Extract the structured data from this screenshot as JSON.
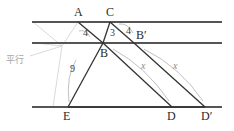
{
  "figure": {
    "type": "geometry-diagram",
    "colors": {
      "parallel_line": "#555555",
      "segment": "#333333",
      "arc": "#b9b9b9",
      "helper": "#cfcfcf",
      "label": "#2b2b2b",
      "x_label": "#8a8a8a",
      "parallel_note": "#a8a8a8",
      "background": "#ffffff"
    },
    "parallel_lines": [
      {
        "name": "top-line",
        "y": 22,
        "x1": 32,
        "x2": 222
      },
      {
        "name": "middle-line",
        "y": 43,
        "x1": 32,
        "x2": 222
      },
      {
        "name": "bottom-line",
        "y": 107,
        "x1": 32,
        "x2": 222
      }
    ],
    "points": [
      {
        "id": "A",
        "label": "A",
        "x": 78,
        "y": 22,
        "label_x": 74,
        "label_y": 6
      },
      {
        "id": "C",
        "label": "C",
        "x": 110,
        "y": 22,
        "label_x": 106,
        "label_y": 6
      },
      {
        "id": "B",
        "label": "B",
        "x": 103,
        "y": 43,
        "label_x": 100,
        "label_y": 47
      },
      {
        "id": "Bp",
        "label": "B′",
        "x": 134,
        "y": 43,
        "label_x": 136,
        "label_y": 29
      },
      {
        "id": "E",
        "label": "E",
        "x": 68,
        "y": 107,
        "label_x": 63,
        "label_y": 110
      },
      {
        "id": "D",
        "label": "D",
        "x": 172,
        "y": 107,
        "label_x": 167,
        "label_y": 110
      },
      {
        "id": "Dp",
        "label": "D′",
        "x": 205,
        "y": 107,
        "label_x": 201,
        "label_y": 110
      }
    ],
    "segments": [
      {
        "name": "A-B",
        "from": "A",
        "to": "B"
      },
      {
        "name": "C-B",
        "from": "C",
        "to": "B"
      },
      {
        "name": "C-Bp",
        "from": "C",
        "to": "Bp"
      },
      {
        "name": "B-E",
        "from": "B",
        "to": "E"
      },
      {
        "name": "B-D",
        "from": "B",
        "to": "D"
      },
      {
        "name": "Bp-Dp",
        "from": "Bp",
        "to": "Dp"
      },
      {
        "name": "E-D",
        "from": "E",
        "to": "D"
      },
      {
        "name": "D-Dp",
        "from": "D",
        "to": "Dp"
      }
    ],
    "measure_labels": [
      {
        "name": "measure-AB",
        "text": "4",
        "x": 83,
        "y": 28,
        "kind": "num"
      },
      {
        "name": "measure-CB",
        "text": "3",
        "x": 110,
        "y": 28,
        "kind": "num"
      },
      {
        "name": "measure-CBp",
        "text": "4",
        "x": 126,
        "y": 26,
        "kind": "num"
      },
      {
        "name": "measure-BE",
        "text": "9",
        "x": 70,
        "y": 64,
        "kind": "num"
      },
      {
        "name": "measure-BD",
        "text": "x",
        "x": 141,
        "y": 61,
        "kind": "x"
      },
      {
        "name": "measure-BpDp",
        "text": "x",
        "x": 173,
        "y": 61,
        "kind": "x"
      }
    ],
    "annotations": [
      {
        "name": "parallel-note",
        "text": "平行",
        "x": 6,
        "y": 56,
        "kind": "parallel"
      }
    ],
    "arcs": [
      {
        "name": "arc-AB",
        "d": "M 79 31 Q 86 29 90 37"
      },
      {
        "name": "arc-CBp",
        "d": "M 119 24 Q 128 23 133 33"
      },
      {
        "name": "arc-BE",
        "d": "M 76 60 Q 66 76 69 102"
      },
      {
        "name": "arc-BD",
        "d": "M 113 49 Q 146 67 169 101"
      },
      {
        "name": "arc-BpDp",
        "d": "M 144 49 Q 180 67 203 101"
      }
    ],
    "helper_lines": [
      {
        "name": "helper-bracket-top",
        "d": "M 33 22 L 62 46"
      },
      {
        "name": "helper-bracket-mid",
        "d": "M 36 43 L 62 46"
      },
      {
        "name": "helper-bracket-bottom",
        "d": "M 62 46 L 53 107"
      },
      {
        "name": "helper-bracket-stem",
        "d": "M 62 46 L 30 56"
      },
      {
        "name": "helper-diag-1",
        "d": "M 62 46 L 78 22"
      },
      {
        "name": "helper-diag-2",
        "d": "M 53 107 L 68 107"
      }
    ]
  }
}
